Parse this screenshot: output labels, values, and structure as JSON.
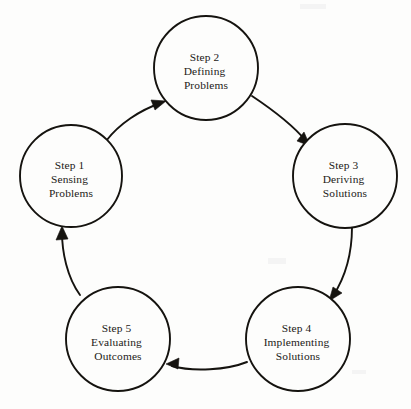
{
  "diagram": {
    "type": "cycle",
    "title": "",
    "background_color": "#fdfdfc",
    "stroke_color": "#15130f",
    "text_color": "#1c1a17",
    "direction": "clockwise",
    "node_count": 5,
    "nodes": [
      {
        "id": "step-1",
        "step_label": "Step 1",
        "line_2": "Sensing",
        "line_3": "Problems",
        "cx": 71,
        "cy": 176,
        "r": 51
      },
      {
        "id": "step-2",
        "step_label": "Step 2",
        "line_2": "Defining",
        "line_3": "Problems",
        "cx": 206,
        "cy": 68,
        "r": 52
      },
      {
        "id": "step-3",
        "step_label": "Step 3",
        "line_2": "Deriving",
        "line_3": "Solutions",
        "cx": 345,
        "cy": 176,
        "r": 52
      },
      {
        "id": "step-4",
        "step_label": "Step 4",
        "line_2": "Implementing",
        "line_3": "Solutions",
        "cx": 298,
        "cy": 339,
        "r": 52
      },
      {
        "id": "step-5",
        "step_label": "Step 5",
        "line_2": "Evaluating",
        "line_3": "Outcomes",
        "cx": 118,
        "cy": 339,
        "r": 52
      }
    ],
    "connectors": [
      {
        "id": "arrow-1-to-2",
        "from": "step-1",
        "to": "step-2",
        "arrowhead": "end"
      },
      {
        "id": "arrow-2-to-3",
        "from": "step-2",
        "to": "step-3",
        "arrowhead": "end"
      },
      {
        "id": "arrow-3-to-4",
        "from": "step-3",
        "to": "step-4",
        "arrowhead": "end"
      },
      {
        "id": "arrow-4-to-5",
        "from": "step-4",
        "to": "step-5",
        "arrowhead": "end"
      },
      {
        "id": "arrow-5-to-1",
        "from": "step-5",
        "to": "step-1",
        "arrowhead": "end"
      }
    ]
  }
}
